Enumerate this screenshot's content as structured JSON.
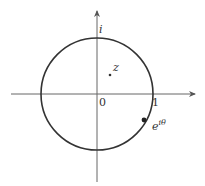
{
  "diagram": {
    "type": "complex-plane-unit-circle",
    "labels": {
      "imaginary_unit": "i",
      "origin": "0",
      "real_one": "1",
      "point_z": "z",
      "point_on_circle_base": "e",
      "point_on_circle_exp": "iθ"
    },
    "colors": {
      "stroke": "#333333",
      "axis": "#666666",
      "background": "#ffffff"
    }
  }
}
